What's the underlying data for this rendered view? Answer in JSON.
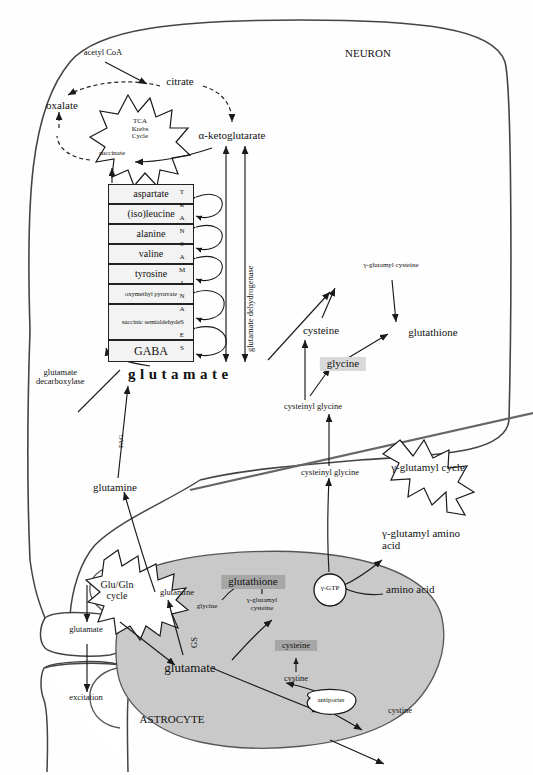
{
  "diagram": {
    "compartments": {
      "neuron_label": "NEURON",
      "astrocyte_label": "ASTROCYTE"
    },
    "colors": {
      "astrocyte_fill": "#c9c9c9",
      "light_box": "#d9d9d9",
      "dark_box": "#a6a6a6",
      "table_fill": "#f3f3f3",
      "stroke": "#1a1a1a",
      "membrane": "#555555"
    },
    "starbursts": [
      {
        "name": "tca-krebs-cycle",
        "lines": [
          "TCA",
          "Krebs",
          "Cycle"
        ]
      },
      {
        "name": "gamma-glutamyl-cycle",
        "lines": [
          "γ-glutamyl cycle"
        ]
      },
      {
        "name": "glu-gln-cycle",
        "lines": [
          "Glu/Gln",
          "cycle"
        ]
      }
    ],
    "neuron": {
      "acetyl_coa": "acetyl CoA",
      "citrate": "citrate",
      "oxalate": "oxalate",
      "succinate": "succinate",
      "alpha_ketoglutarate": "α-ketoglutarate",
      "glutamate_dehydrogenase": "glutamate dehydrogenase",
      "transaminases_letters": [
        "T",
        "R",
        "A",
        "N",
        "S",
        "A",
        "M",
        "I",
        "N",
        "A",
        "S",
        "E",
        "S"
      ],
      "substrates": [
        "aspartate",
        "(iso)leucine",
        "alanine",
        "valine",
        "tyrosine",
        "oxymethyl pyruvate",
        "succinic semialdehyde",
        "GABA"
      ],
      "glutamate_main": "glutamate",
      "glutamate_decarboxylase": [
        "glutamate",
        "decarboxylase"
      ],
      "pag": "PAG",
      "glutamine": "glutamine",
      "gamma_glutamyl_cysteine": "γ-glutamyl cysteine",
      "cysteine": "cysteine",
      "glutathione": "glutathione",
      "glycine": "glycine",
      "cysteinyl_glycine": "cysteinyl glycine"
    },
    "extracellular": {
      "cysteinyl_glycine": "cysteinyl glycine",
      "gamma_gtp": "γ-GTP",
      "gamma_glutamyl_amino_acid": [
        "γ-glutamyl amino",
        "acid"
      ],
      "amino_acid": "amino acid",
      "cystine_out": "cystine",
      "antiporter": "antiporter"
    },
    "synapse": {
      "glutamate": "glutamate",
      "excitation": "excitation"
    },
    "astrocyte": {
      "glutamine": "glutamine",
      "gs": "GS",
      "glutamate": "glutamate",
      "glutathione": "glutathione",
      "glycine": "glycine",
      "gamma_glutamyl_cysteine": [
        "γ-glutamyl",
        "cysteine"
      ],
      "cysteine": "cysteine",
      "cystine": "cystine"
    }
  }
}
